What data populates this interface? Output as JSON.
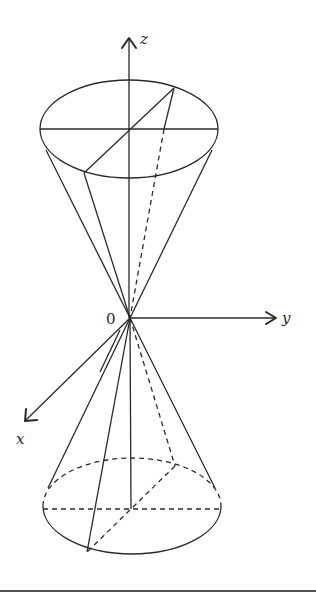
{
  "diagram": {
    "type": "double-cone-3d-axes",
    "axes": {
      "z": {
        "label": "z",
        "direction": "up"
      },
      "y": {
        "label": "y",
        "direction": "right"
      },
      "x": {
        "label": "x",
        "direction": "down-left"
      }
    },
    "origin": {
      "label": "0"
    },
    "shapes": [
      {
        "name": "upper-cone",
        "base": "ellipse-top",
        "apex": "origin",
        "opening": "up"
      },
      {
        "name": "lower-cone",
        "base": "ellipse-bottom",
        "apex": "origin",
        "opening": "down",
        "hidden_edges": "dashed"
      }
    ],
    "colors": {
      "stroke": "#2a2a2a",
      "background": "#ffffff"
    }
  }
}
